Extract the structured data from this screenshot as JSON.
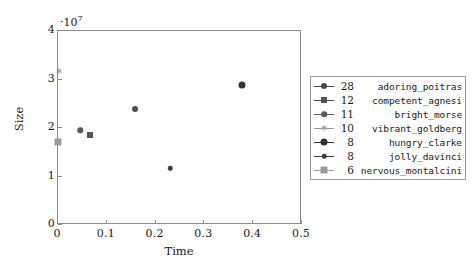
{
  "chart_data": {
    "type": "scatter",
    "title": "",
    "xlabel": "Time",
    "ylabel": "Size",
    "xlim": [
      0,
      0.5
    ],
    "ylim": [
      0,
      40000000
    ],
    "y_exponent_label": "·10",
    "y_exponent_value": "7",
    "grid": false,
    "legend_position": "right-outside",
    "xticks": [
      "0",
      "0.1",
      "0.2",
      "0.3",
      "0.4",
      "0.5"
    ],
    "xtick_values": [
      0,
      0.1,
      0.2,
      0.3,
      0.4,
      0.5
    ],
    "yticks": [
      "0",
      "1",
      "2",
      "3",
      "4"
    ],
    "ytick_values": [
      0,
      10000000,
      20000000,
      30000000,
      40000000
    ],
    "series": [
      {
        "name": "adoring_poitras",
        "count": "28",
        "marker": "circle",
        "size": 6,
        "color": "#4a4a4a",
        "x": 0.16,
        "y": 23800000
      },
      {
        "name": "competent_agnesi",
        "count": "12",
        "marker": "square",
        "size": 6,
        "color": "#555555",
        "x": 0.068,
        "y": 18400000
      },
      {
        "name": "bright_morse",
        "count": "11",
        "marker": "circle",
        "size": 5.5,
        "color": "#5a5a5a",
        "x": 0.048,
        "y": 19300000
      },
      {
        "name": "vibrant_goldberg",
        "count": "10",
        "marker": "star",
        "size": 5,
        "color": "#9a9a9a",
        "x": 0.004,
        "y": 31500000
      },
      {
        "name": "hungry_clarke",
        "count": "8",
        "marker": "circle",
        "size": 7,
        "color": "#333333",
        "x": 0.38,
        "y": 28700000
      },
      {
        "name": "jolly_davinci",
        "count": "8",
        "marker": "circle",
        "size": 4.5,
        "color": "#3d3d3d",
        "x": 0.232,
        "y": 11500000
      },
      {
        "name": "nervous_montalcini",
        "count": "6",
        "marker": "square",
        "size": 7,
        "color": "#9b9b9b",
        "x": 0.002,
        "y": 17000000
      }
    ]
  },
  "colors": {
    "axis": "#8d8d8d",
    "legend_border": "#9a9a9a",
    "text": "#1a1a1a",
    "background": "#ffffff"
  }
}
